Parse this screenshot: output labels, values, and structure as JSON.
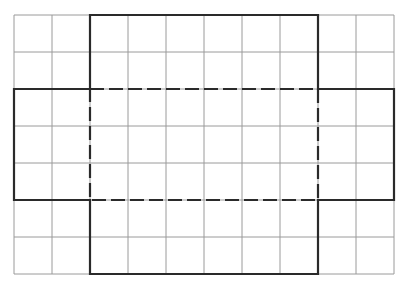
{
  "diagram": {
    "type": "box-net-on-grid",
    "grid": {
      "columns": 10,
      "rows": 7,
      "x_lines": [
        14,
        52,
        90,
        128,
        166,
        204,
        242,
        280,
        318,
        356,
        394
      ],
      "y_lines": [
        15,
        52,
        89,
        126,
        163,
        200,
        237,
        274
      ],
      "line_color": "#9a9a9a",
      "line_width": 1
    },
    "net_outline": {
      "description": "Cross-shaped net of an open box: center base with four flaps",
      "color": "#2a2a2a",
      "width": 2.2,
      "cells": {
        "col_start": 0,
        "col_end": 10,
        "row_start": 0,
        "row_end": 7
      },
      "base": {
        "col_start": 2,
        "col_end": 8,
        "row_start": 2,
        "row_end": 5
      },
      "top_flap": {
        "col_start": 2,
        "col_end": 8,
        "row_start": 0,
        "row_end": 2
      },
      "bottom_flap": {
        "col_start": 2,
        "col_end": 8,
        "row_start": 5,
        "row_end": 7
      },
      "left_flap": {
        "col_start": 0,
        "col_end": 2,
        "row_start": 2,
        "row_end": 5
      },
      "right_flap": {
        "col_start": 8,
        "col_end": 10,
        "row_start": 2,
        "row_end": 5
      }
    },
    "fold_lines": {
      "style": "dashed",
      "color": "#2a2a2a",
      "width": 2.2,
      "dash": "14 5"
    },
    "background": "#ffffff"
  }
}
